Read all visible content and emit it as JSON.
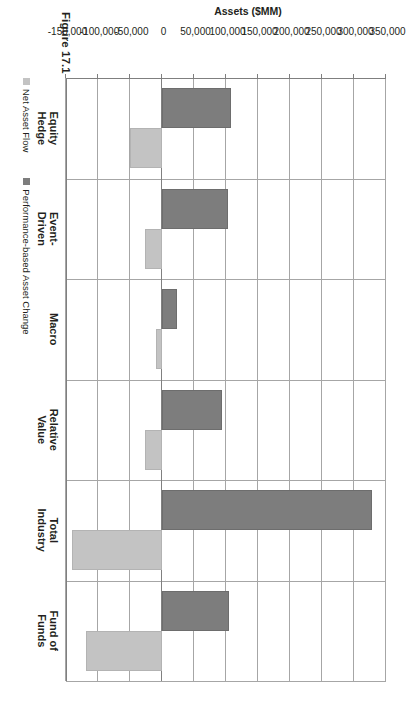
{
  "figure": {
    "caption": "Figure 17.1"
  },
  "chart_data": {
    "type": "bar",
    "orientation": "vertical",
    "title": "",
    "xlabel": "",
    "ylabel": "Assets ($MM)",
    "ylim": [
      -150000,
      350000
    ],
    "grid": true,
    "legend_position": "bottom-left",
    "categories": [
      "Equity Hedge",
      "Event-Driven",
      "Macro",
      "Relative Value",
      "Total Industry",
      "Fund of Funds"
    ],
    "category_lines": [
      [
        "Equity",
        "Hedge"
      ],
      [
        "Event-",
        "Driven"
      ],
      [
        "Macro",
        ""
      ],
      [
        "Relative",
        "Value"
      ],
      [
        "Total",
        "Industry"
      ],
      [
        "Fund of",
        "Funds"
      ]
    ],
    "tick_labels": [
      "350,000",
      "300,000",
      "250,000",
      "200,000",
      "150,000",
      "100,000",
      "50,000",
      "0",
      "-50,000",
      "-100,000",
      "-150,000"
    ],
    "tick_values": [
      350000,
      300000,
      250000,
      200000,
      150000,
      100000,
      50000,
      0,
      -50000,
      -100000,
      -150000
    ],
    "series": [
      {
        "name": "Net Asset Flow",
        "color": "#c3c3c3",
        "values": [
          -50000,
          -27000,
          -10000,
          -27000,
          -140000,
          -118000
        ]
      },
      {
        "name": "Performance-based Asset Change",
        "color": "#7d7d7d",
        "values": [
          108000,
          103000,
          23000,
          94000,
          328000,
          104000
        ]
      }
    ]
  },
  "legend": {
    "items": [
      {
        "label": "Net Asset Flow",
        "swatch": "light"
      },
      {
        "label": "Performance-based Asset Change",
        "swatch": "dark"
      }
    ]
  }
}
